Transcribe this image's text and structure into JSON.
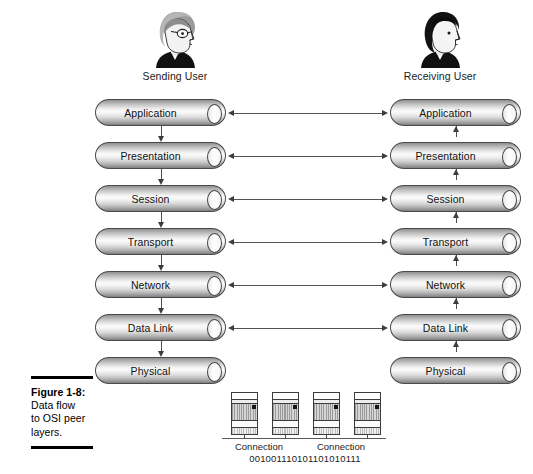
{
  "figure": {
    "number": "Figure 1-8:",
    "caption_lines": [
      "Data flow",
      "to OSI peer",
      "layers."
    ]
  },
  "users": {
    "sending": {
      "label": "Sending User",
      "icon": "person-head-gray-hair-glasses-icon"
    },
    "receiving": {
      "label": "Receiving User",
      "icon": "person-head-dark-hair-icon"
    }
  },
  "stacks": {
    "left": {
      "title": "Sending User",
      "flow_direction": "down",
      "layers": [
        {
          "name": "Application"
        },
        {
          "name": "Presentation"
        },
        {
          "name": "Session"
        },
        {
          "name": "Transport"
        },
        {
          "name": "Network"
        },
        {
          "name": "Data Link"
        },
        {
          "name": "Physical"
        }
      ]
    },
    "right": {
      "title": "Receiving User",
      "flow_direction": "up",
      "layers": [
        {
          "name": "Application"
        },
        {
          "name": "Presentation"
        },
        {
          "name": "Session"
        },
        {
          "name": "Transport"
        },
        {
          "name": "Network"
        },
        {
          "name": "Data Link"
        },
        {
          "name": "Physical"
        }
      ]
    }
  },
  "peer_links": [
    {
      "layer": "Application",
      "type": "bidirectional"
    },
    {
      "layer": "Presentation",
      "type": "bidirectional"
    },
    {
      "layer": "Session",
      "type": "bidirectional"
    },
    {
      "layer": "Transport",
      "type": "bidirectional"
    },
    {
      "layer": "Network",
      "type": "bidirectional"
    },
    {
      "layer": "Data Link",
      "type": "bidirectional"
    }
  ],
  "physical_medium": {
    "devices": [
      {
        "icon": "network-connection-device-icon"
      },
      {
        "icon": "network-connection-device-icon"
      },
      {
        "icon": "network-connection-device-icon"
      },
      {
        "icon": "network-connection-device-icon"
      }
    ],
    "labels": [
      "Connection",
      "Connection"
    ],
    "bitstream": "001001110101101010111"
  },
  "colors": {
    "cylinder_outline": "#4a4a4a",
    "cylinder_highlight": "#fbfbfb",
    "cylinder_shadow": "#7c7c7c",
    "arrow": "#3d3d3d",
    "text": "#111111",
    "rule": "#000000"
  }
}
